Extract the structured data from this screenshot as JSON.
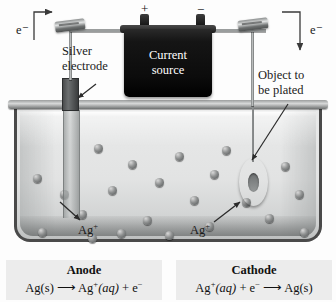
{
  "figure": {
    "labels": {
      "electron_left": "e⁻",
      "electron_right": "e⁻",
      "plus_terminal": "+",
      "minus_terminal": "−",
      "current_source_line1": "Current",
      "current_source_line2": "source",
      "silver_electrode_line1": "Silver",
      "silver_electrode_line2": "electrode",
      "object_line1": "Object to",
      "object_line2": "be plated",
      "ion_left": "Ag",
      "ion_left_charge": "+",
      "ion_right": "Ag",
      "ion_right_charge": "+"
    },
    "equations": {
      "anode": {
        "title": "Anode",
        "reactant": "Ag(s)",
        "arrow": "⟶",
        "product1": "Ag",
        "product1_charge": "+",
        "product1_state": "(aq)",
        "plus": "+",
        "product2": "e",
        "product2_charge": "−"
      },
      "cathode": {
        "title": "Cathode",
        "reactant1": "Ag",
        "reactant1_charge": "+",
        "reactant1_state": "(aq)",
        "plus": "+",
        "reactant2": "e",
        "reactant2_charge": "−",
        "arrow": "⟶",
        "product": "Ag(s)"
      }
    },
    "colors": {
      "tank_solution": "#e6e7e7",
      "battery_body": "#101010",
      "wire": "#9a9d9d",
      "electrode_dry": "#4a4c4d",
      "ion": "#8e9090",
      "equation_background": "#ececec",
      "text": "#1a1a1a"
    },
    "ions": [
      {
        "x": 33,
        "y": 174
      },
      {
        "x": 94,
        "y": 144
      },
      {
        "x": 60,
        "y": 190
      },
      {
        "x": 128,
        "y": 160
      },
      {
        "x": 108,
        "y": 186
      },
      {
        "x": 78,
        "y": 210
      },
      {
        "x": 155,
        "y": 178
      },
      {
        "x": 175,
        "y": 152
      },
      {
        "x": 190,
        "y": 196
      },
      {
        "x": 210,
        "y": 170
      },
      {
        "x": 143,
        "y": 216
      },
      {
        "x": 222,
        "y": 146
      },
      {
        "x": 281,
        "y": 162
      },
      {
        "x": 295,
        "y": 190
      },
      {
        "x": 265,
        "y": 214
      },
      {
        "x": 205,
        "y": 222
      },
      {
        "x": 117,
        "y": 229
      },
      {
        "x": 38,
        "y": 228
      },
      {
        "x": 300,
        "y": 228
      },
      {
        "x": 242,
        "y": 198
      },
      {
        "x": 88,
        "y": 234
      },
      {
        "x": 165,
        "y": 231
      }
    ]
  }
}
